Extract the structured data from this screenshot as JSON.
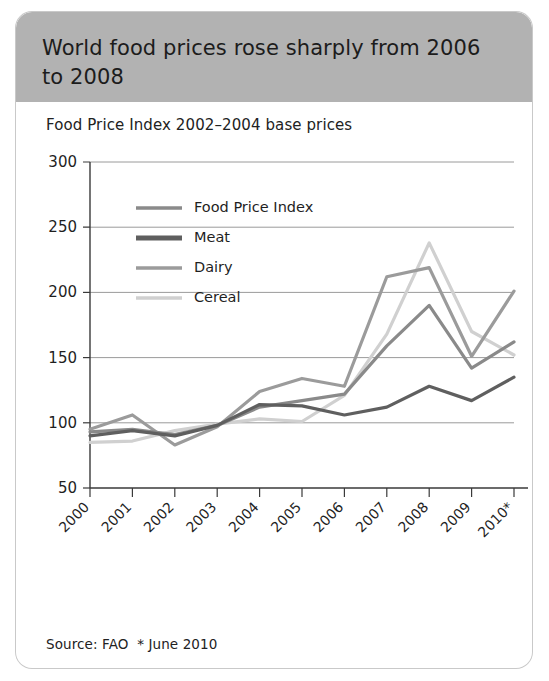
{
  "header": {
    "title": "World food prices rose sharply from 2006 to 2008"
  },
  "chart_subtitle": "Food Price Index 2002–2004 base prices",
  "source_note": "Source: FAO  * June 2010",
  "colors": {
    "header_band": "#b2b2b2",
    "card_background": "#ffffff",
    "food_price_index": "#8a8a8a",
    "meat": "#5f5f5f",
    "dairy": "#9b9b9b",
    "cereal": "#d0d0d0",
    "gridline": "#8e8e8e",
    "axis": "#3a3a3a"
  },
  "chart_data": {
    "type": "line",
    "title": "World food prices rose sharply from 2006 to 2008",
    "subtitle": "Food Price Index 2002–2004 base prices",
    "xlabel": "",
    "ylabel": "",
    "grid": true,
    "legend_position": "inside-top-left",
    "categories": [
      "2000",
      "2001",
      "2002",
      "2003",
      "2004",
      "2005",
      "2006",
      "2007",
      "2008",
      "2009",
      "2010*"
    ],
    "x": [
      2000,
      2001,
      2002,
      2003,
      2004,
      2005,
      2006,
      2007,
      2008,
      2009,
      2010
    ],
    "ylim": [
      50,
      300
    ],
    "yticks": [
      50,
      100,
      150,
      200,
      250,
      300
    ],
    "series": [
      {
        "name": "Food Price Index",
        "color": "#8a8a8a",
        "values": [
          93,
          95,
          91,
          98,
          112,
          117,
          122,
          159,
          190,
          142,
          162
        ]
      },
      {
        "name": "Meat",
        "color": "#5f5f5f",
        "values": [
          90,
          94,
          90,
          98,
          114,
          113,
          106,
          112,
          128,
          117,
          135
        ]
      },
      {
        "name": "Dairy",
        "color": "#9b9b9b",
        "values": [
          95,
          106,
          83,
          97,
          124,
          134,
          128,
          212,
          219,
          151,
          201
        ]
      },
      {
        "name": "Cereal",
        "color": "#d0d0d0",
        "values": [
          85,
          86,
          94,
          99,
          103,
          101,
          121,
          168,
          238,
          170,
          152
        ]
      }
    ]
  }
}
